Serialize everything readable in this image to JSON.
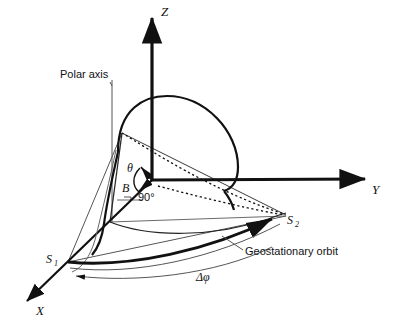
{
  "figure": {
    "type": "geometry-diagram",
    "background_color": "#ffffff",
    "line_color": "#111111",
    "thin_line_color": "#4a4a4a"
  },
  "axes": {
    "z_label": "Z",
    "y_label": "Y",
    "x_label": "X"
  },
  "labels": {
    "polar_axis": "Polar axis",
    "theta": "θ",
    "b_point": "B",
    "right_angle": "90°",
    "s1": "S",
    "s1_sub": "1",
    "s2": "S",
    "s2_sub": "2",
    "orbit": "Geostationary orbit",
    "delta_phi": "Δφ"
  },
  "geometry": {
    "origin": [
      152,
      180
    ],
    "z_axis_tip": [
      152,
      12
    ],
    "y_axis_tip": [
      371,
      179
    ],
    "x_axis_tip": [
      22,
      306
    ],
    "polar_axis_line": [
      [
        112,
        80
      ],
      [
        112,
        222
      ]
    ],
    "sphere_arc_top": [
      152,
      97
    ],
    "quad_top_left": [
      122,
      133
    ],
    "quad_bottom_left": [
      110,
      222
    ],
    "s1_point": [
      68,
      262
    ],
    "s2_point": [
      286,
      216
    ],
    "dotted_focus": [
      286,
      215
    ]
  },
  "annotations": {
    "theta_arc_description": "angle from Z axis (polar angle) at origin",
    "right_angle_marker": "90 degree marker between polar axis and equatorial plane",
    "delta_phi_arc": "longitude difference between S1 and S2 along orbit"
  }
}
